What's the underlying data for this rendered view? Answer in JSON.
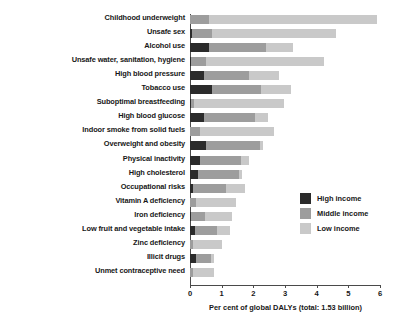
{
  "chart_data": {
    "type": "bar",
    "orientation": "horizontal",
    "stacked": true,
    "title": "",
    "xlabel": "Per cent of global DALYs (total: 1.53 billion)",
    "ylabel": "",
    "xlim": [
      0,
      6
    ],
    "xticks": [
      0,
      1,
      2,
      3,
      4,
      5,
      6
    ],
    "xtick_labels": [
      "0",
      "1",
      "2",
      "3",
      "4",
      "5",
      "6"
    ],
    "grid": false,
    "legend_position": "center-right",
    "categories": [
      "Childhood underweight",
      "Unsafe sex",
      "Alcohol use",
      "Unsafe water, sanitation, hygiene",
      "High blood pressure",
      "Tobacco use",
      "Suboptimal breastfeeding",
      "High blood glucose",
      "Indoor smoke from solid fuels",
      "Overweight and obesity",
      "Physical inactivity",
      "High cholesterol",
      "Occupational risks",
      "Vitamin A deficiency",
      "Iron deficiency",
      "Low fruit and vegetable intake",
      "Zinc deficiency",
      "Illicit drugs",
      "Unmet contraceptive need"
    ],
    "series": [
      {
        "name": "High income",
        "color": "#2b2b2b",
        "values": [
          0.0,
          0.05,
          0.6,
          0.02,
          0.45,
          0.7,
          0.02,
          0.45,
          0.0,
          0.5,
          0.3,
          0.25,
          0.1,
          0.0,
          0.03,
          0.15,
          0.0,
          0.2,
          0.0
        ]
      },
      {
        "name": "Middle income",
        "color": "#9d9d9d",
        "values": [
          0.6,
          0.65,
          1.8,
          0.5,
          1.4,
          1.55,
          0.1,
          1.6,
          0.3,
          1.7,
          1.3,
          1.3,
          1.05,
          0.2,
          0.45,
          0.7,
          0.1,
          0.45,
          0.1
        ]
      },
      {
        "name": "Low income",
        "color": "#c9c9c9",
        "values": [
          5.3,
          3.9,
          0.85,
          3.7,
          0.95,
          0.95,
          2.85,
          0.4,
          2.35,
          0.1,
          0.25,
          0.1,
          0.6,
          1.25,
          0.85,
          0.4,
          0.9,
          0.1,
          0.65
        ]
      }
    ],
    "totals": [
      5.9,
      4.6,
      3.25,
      4.22,
      2.8,
      3.2,
      2.97,
      2.45,
      2.65,
      2.3,
      1.85,
      1.65,
      1.75,
      1.45,
      1.33,
      1.25,
      1.0,
      0.75,
      0.75
    ]
  },
  "legend": {
    "items": [
      {
        "label": "High income",
        "swatch": "high"
      },
      {
        "label": "Middle income",
        "swatch": "middle"
      },
      {
        "label": "Low income",
        "swatch": "low"
      }
    ]
  }
}
